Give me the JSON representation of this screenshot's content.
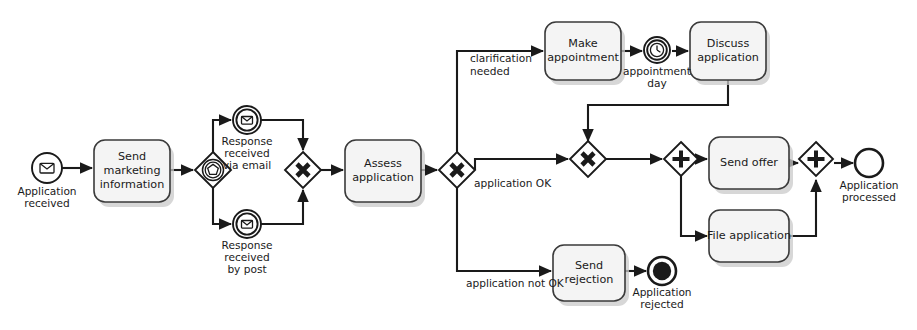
{
  "diagram": {
    "notation": "BPMN",
    "colors": {
      "stroke": "#1a1a1a",
      "task_fill": "#f4f4f4",
      "task_stroke": "#3a3a3a",
      "event_fill": "#ffffff",
      "gateway_fill": "#ffffff",
      "background": "#ffffff",
      "shadow": "#c9c9c9"
    },
    "events": [
      {
        "id": "start-application-received",
        "label": "Application received",
        "label_lines": [
          "Application",
          "received"
        ],
        "icon": "envelope-icon",
        "kind": "message-start-event",
        "x": 47,
        "y": 168,
        "r": 15
      },
      {
        "id": "intermediate-response-email",
        "label": "Response received via email",
        "label_lines": [
          "Response",
          "received",
          "via email"
        ],
        "icon": "envelope-icon",
        "kind": "message-intermediate-catch-event",
        "x": 247,
        "y": 120,
        "r": 14
      },
      {
        "id": "intermediate-response-post",
        "label": "Response received by post",
        "label_lines": [
          "Response",
          "received",
          "by post"
        ],
        "icon": "envelope-icon",
        "kind": "message-intermediate-catch-event",
        "x": 247,
        "y": 224,
        "r": 14
      },
      {
        "id": "intermediate-appointment-day",
        "label": "appointment day",
        "label_lines": [
          "appointment",
          "day"
        ],
        "icon": "clock-icon",
        "kind": "timer-intermediate-catch-event",
        "x": 657,
        "y": 50,
        "r": 13
      },
      {
        "id": "end-application-rejected",
        "label": "Application rejected",
        "label_lines": [
          "Application",
          "rejected"
        ],
        "icon": "terminate-icon",
        "kind": "terminate-end-event",
        "x": 662,
        "y": 271,
        "r": 14
      },
      {
        "id": "end-application-processed",
        "label": "Application processed",
        "label_lines": [
          "Application",
          "processed"
        ],
        "icon": "none",
        "kind": "end-event",
        "x": 869,
        "y": 163,
        "r": 14
      }
    ],
    "tasks": [
      {
        "id": "task-send-marketing-information",
        "label": "Send marketing information",
        "label_lines": [
          "Send",
          "marketing",
          "information"
        ],
        "x": 94,
        "y": 140,
        "w": 76,
        "h": 62
      },
      {
        "id": "task-assess-application",
        "label": "Assess application",
        "label_lines": [
          "Assess",
          "application"
        ],
        "x": 345,
        "y": 140,
        "w": 76,
        "h": 62
      },
      {
        "id": "task-make-appointment",
        "label": "Make appointment",
        "label_lines": [
          "Make",
          "appointment"
        ],
        "x": 545,
        "y": 22,
        "w": 76,
        "h": 58
      },
      {
        "id": "task-discuss-application",
        "label": "Discuss application",
        "label_lines": [
          "Discuss",
          "application"
        ],
        "x": 690,
        "y": 22,
        "w": 76,
        "h": 58
      },
      {
        "id": "task-send-rejection",
        "label": "Send rejection",
        "label_lines": [
          "Send",
          "rejection"
        ],
        "x": 553,
        "y": 245,
        "w": 72,
        "h": 56
      },
      {
        "id": "task-send-offer",
        "label": "Send offer",
        "label_lines": [
          "Send offer"
        ],
        "x": 709,
        "y": 137,
        "w": 80,
        "h": 52
      },
      {
        "id": "task-file-application",
        "label": "File application",
        "label_lines": [
          "File application"
        ],
        "x": 709,
        "y": 210,
        "w": 80,
        "h": 52
      }
    ],
    "gateways": [
      {
        "id": "gateway-event-based-split",
        "kind": "event-based-gateway",
        "symbol": "pentagon-in-double-circle",
        "x": 213,
        "y": 170,
        "half": 18
      },
      {
        "id": "gateway-xor-join-response",
        "kind": "exclusive-gateway",
        "symbol": "x",
        "x": 303,
        "y": 170,
        "half": 18
      },
      {
        "id": "gateway-xor-split-assessment",
        "kind": "exclusive-gateway",
        "symbol": "x",
        "x": 457,
        "y": 170,
        "half": 18
      },
      {
        "id": "gateway-xor-join-clarification",
        "kind": "exclusive-gateway",
        "symbol": "x",
        "x": 588,
        "y": 159,
        "half": 18
      },
      {
        "id": "gateway-parallel-split",
        "kind": "parallel-gateway",
        "symbol": "plus",
        "x": 681,
        "y": 159,
        "half": 17
      },
      {
        "id": "gateway-parallel-join",
        "kind": "parallel-gateway",
        "symbol": "plus",
        "x": 816,
        "y": 159,
        "half": 17
      }
    ],
    "flow_labels": [
      {
        "id": "label-clarification-needed",
        "text_lines": [
          "clarification",
          "needed"
        ],
        "x": 470,
        "y": 57
      },
      {
        "id": "label-application-ok",
        "text_lines": [
          "application OK"
        ],
        "x": 474,
        "y": 184
      },
      {
        "id": "label-application-not-ok",
        "text_lines": [
          "application not OK"
        ],
        "x": 466,
        "y": 283
      }
    ]
  }
}
